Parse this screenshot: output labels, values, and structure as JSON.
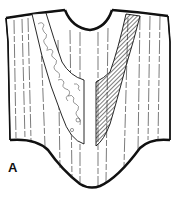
{
  "figure": {
    "label": "A",
    "ink_color": "#111111",
    "paper_color": "#ffffff"
  }
}
